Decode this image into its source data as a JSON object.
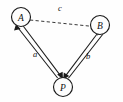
{
  "diagram": {
    "type": "vector-force-diagram",
    "background_color": "#fefefe",
    "stroke_color": "#1a1a1a",
    "nodes": [
      {
        "id": "A",
        "label": "A",
        "cx": 21,
        "cy": 17,
        "r": 9.5
      },
      {
        "id": "B",
        "label": "B",
        "cx": 100,
        "cy": 25,
        "r": 9.5
      },
      {
        "id": "P",
        "label": "P",
        "cx": 63,
        "cy": 87,
        "r": 9.5
      }
    ],
    "edges": [
      {
        "id": "edge-a",
        "label": "a",
        "from": "A",
        "to": "P",
        "style": "double-solid",
        "arrows": "both",
        "label_x": 35,
        "label_y": 54
      },
      {
        "id": "edge-b",
        "label": "b",
        "from": "B",
        "to": "P",
        "style": "double-solid",
        "arrows": "both",
        "label_x": 88,
        "label_y": 56
      },
      {
        "id": "edge-c",
        "label": "c",
        "from": "A",
        "to": "B",
        "style": "dashed",
        "arrows": "none",
        "label_x": 60,
        "label_y": 8
      }
    ]
  }
}
